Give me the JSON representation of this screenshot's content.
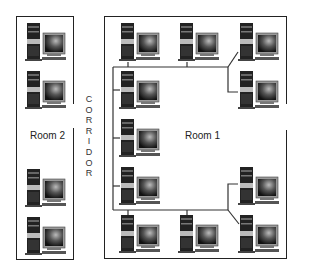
{
  "rooms": [
    {
      "label": "Room 2"
    },
    {
      "label": "Room 1"
    }
  ],
  "corridor": {
    "letters": [
      "C",
      "O",
      "R",
      "R",
      "I",
      "D",
      "O",
      "R"
    ]
  },
  "computers": {
    "room2": [
      {
        "x": 24,
        "y": 22
      },
      {
        "x": 24,
        "y": 70
      },
      {
        "x": 24,
        "y": 168
      },
      {
        "x": 24,
        "y": 216
      }
    ],
    "room1": [
      {
        "x": 118,
        "y": 22
      },
      {
        "x": 177,
        "y": 22
      },
      {
        "x": 237,
        "y": 22
      },
      {
        "x": 118,
        "y": 70
      },
      {
        "x": 237,
        "y": 70
      },
      {
        "x": 118,
        "y": 118
      },
      {
        "x": 118,
        "y": 166
      },
      {
        "x": 237,
        "y": 166
      },
      {
        "x": 118,
        "y": 214
      },
      {
        "x": 177,
        "y": 214
      },
      {
        "x": 237,
        "y": 214
      }
    ]
  }
}
